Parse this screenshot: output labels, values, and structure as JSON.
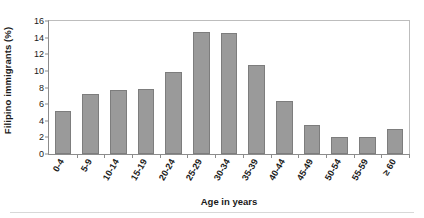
{
  "chart_data": {
    "type": "bar",
    "title": "",
    "xlabel": "Age in years",
    "ylabel": "Filipino immigrants (%)",
    "categories": [
      "0-4",
      "5-9",
      "10-14",
      "15-19",
      "20-24",
      "25-29",
      "30-34",
      "35-39",
      "40-44",
      "45-49",
      "50-54",
      "55-59",
      "≥ 60"
    ],
    "values": [
      5.2,
      7.2,
      7.7,
      7.8,
      9.9,
      14.7,
      14.6,
      10.7,
      6.4,
      3.5,
      2.0,
      2.1,
      3.0
    ],
    "ylim": [
      0,
      16
    ],
    "yticks": [
      0,
      2,
      4,
      6,
      8,
      10,
      12,
      14,
      16
    ],
    "ytick_labels": [
      "0",
      "2",
      "4",
      "6",
      "8",
      "10",
      "12",
      "14",
      "16"
    ],
    "grid": false,
    "legend": false,
    "bar_color": "#9a9a9a",
    "bar_edge_color": "#7d7d7d",
    "axis_color": "#8c8c8c",
    "frame_color": "#bdbdbd",
    "text_color": "#1a1a1a"
  }
}
